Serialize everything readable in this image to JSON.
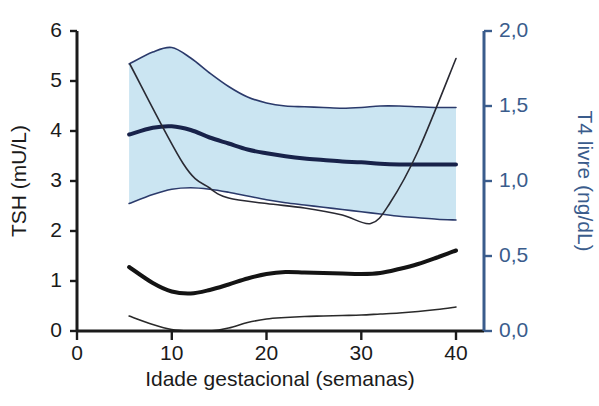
{
  "chart_data": {
    "type": "line",
    "title": "",
    "xlabel": "Idade gestacional (semanas)",
    "ylabel": "TSH (mU/L)",
    "ylabel_right": "T4 livre (ng/dL)",
    "grid": false,
    "legend": "none",
    "xlim": [
      0,
      42
    ],
    "xticks": [
      0,
      10,
      20,
      30,
      40
    ],
    "xtick_labels": [
      "0",
      "10",
      "20",
      "30",
      "40"
    ],
    "ylim_left": [
      0,
      6
    ],
    "yticks_left": [
      0,
      1,
      2,
      3,
      4,
      5,
      6
    ],
    "ytick_labels_left": [
      "0",
      "1",
      "2",
      "3",
      "4",
      "5",
      "6"
    ],
    "ylim_right": [
      0.0,
      2.0
    ],
    "yticks_right": [
      0.0,
      0.5,
      1.0,
      1.5,
      2.0
    ],
    "ytick_labels_right": [
      "0,0",
      "0,5",
      "1,0",
      "1,5",
      "2,0"
    ],
    "x": [
      5.5,
      8,
      10,
      12,
      14,
      16,
      18,
      20,
      22,
      24,
      26,
      28,
      30,
      32,
      34,
      36,
      38,
      40
    ],
    "series": [
      {
        "name": "T4 livre - limite superior",
        "axis": "right",
        "unit": "ng/dL",
        "color": "#2b3a6b",
        "width": 1.6,
        "values": [
          1.78,
          1.86,
          1.89,
          1.82,
          1.72,
          1.63,
          1.56,
          1.52,
          1.5,
          1.495,
          1.49,
          1.485,
          1.49,
          1.5,
          1.5,
          1.495,
          1.49,
          1.49
        ]
      },
      {
        "name": "T4 livre - mediana",
        "axis": "right",
        "unit": "ng/dL",
        "color": "#18224a",
        "width": 4.0,
        "values": [
          1.31,
          1.355,
          1.365,
          1.34,
          1.29,
          1.25,
          1.21,
          1.185,
          1.165,
          1.15,
          1.14,
          1.13,
          1.125,
          1.115,
          1.11,
          1.11,
          1.11,
          1.11
        ]
      },
      {
        "name": "T4 livre - limite inferior",
        "axis": "right",
        "unit": "ng/dL",
        "color": "#2b3a6b",
        "width": 1.6,
        "values": [
          0.85,
          0.91,
          0.945,
          0.955,
          0.945,
          0.925,
          0.9,
          0.875,
          0.855,
          0.84,
          0.825,
          0.81,
          0.795,
          0.78,
          0.765,
          0.755,
          0.745,
          0.74
        ]
      },
      {
        "name": "TSH - mediana",
        "axis": "left",
        "unit": "mU/L",
        "color": "#141414",
        "width": 4.0,
        "values": [
          1.28,
          0.96,
          0.79,
          0.75,
          0.82,
          0.93,
          1.05,
          1.14,
          1.18,
          1.17,
          1.16,
          1.15,
          1.14,
          1.16,
          1.24,
          1.34,
          1.47,
          1.61
        ]
      },
      {
        "name": "TSH - limite inferior",
        "axis": "left",
        "unit": "mU/L",
        "color": "#2a2a2a",
        "width": 1.6,
        "values": [
          0.3,
          0.13,
          0.03,
          0.0,
          0.0,
          0.06,
          0.17,
          0.24,
          0.27,
          0.29,
          0.3,
          0.31,
          0.32,
          0.34,
          0.36,
          0.39,
          0.43,
          0.48
        ]
      }
    ],
    "annotations": [
      {
        "name": "linha-diagonal-hcg",
        "description": "Linha diagonal escura cruzando o grafico",
        "color": "#2a2a33",
        "width": 1.6,
        "points": [
          [
            5.6,
            5.33
          ],
          [
            11.2,
            3.35
          ],
          [
            14.0,
            2.86
          ],
          [
            16.0,
            2.66
          ],
          [
            20.0,
            2.55
          ],
          [
            24.0,
            2.46
          ],
          [
            28.0,
            2.32
          ],
          [
            31.0,
            2.15
          ],
          [
            33.0,
            2.55
          ],
          [
            36.0,
            3.6
          ],
          [
            40.0,
            5.45
          ]
        ],
        "axis": "left"
      }
    ],
    "band": {
      "name": "faixa-de-referencia-t4-livre",
      "axis": "right",
      "fill_color": "#cbe5f2",
      "x_start": 5.5,
      "x_end": 40
    },
    "colors": {
      "band_fill": "#cbe5f2",
      "left_axis": "#1b1b1b",
      "right_axis": "#3a5c8c",
      "tsh_line": "#141414",
      "t4_line": "#2b3a6b"
    }
  }
}
